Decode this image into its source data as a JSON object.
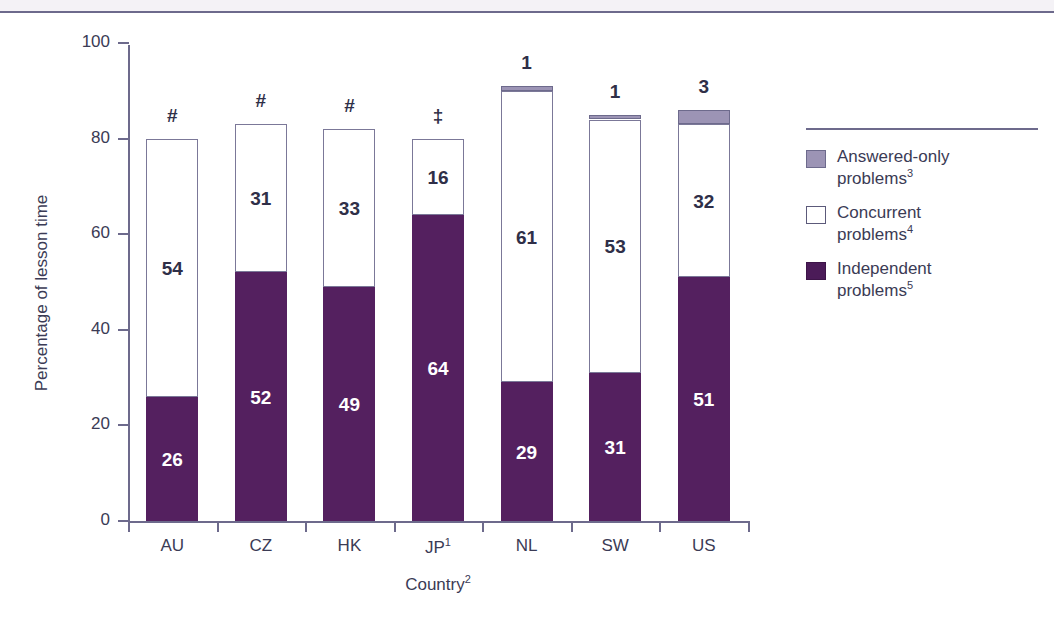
{
  "chart_data": {
    "type": "bar",
    "subtype": "stacked-bar",
    "title": "",
    "xlabel": "Country",
    "xlabel_superscript": "2",
    "ylabel": "Percentage of lesson time",
    "ylim": [
      0,
      100
    ],
    "ytick_labels": [
      "0",
      "20",
      "40",
      "60",
      "80",
      "100"
    ],
    "ytick_values": [
      0,
      20,
      40,
      60,
      80,
      100
    ],
    "grid": false,
    "legend_position": "right",
    "categories": [
      "AU",
      "CZ",
      "HK",
      "JP",
      "NL",
      "SW",
      "US"
    ],
    "category_labels": [
      {
        "text": "AU",
        "sup": ""
      },
      {
        "text": "CZ",
        "sup": ""
      },
      {
        "text": "HK",
        "sup": ""
      },
      {
        "text": "JP",
        "sup": "1"
      },
      {
        "text": "NL",
        "sup": ""
      },
      {
        "text": "SW",
        "sup": ""
      },
      {
        "text": "US",
        "sup": ""
      }
    ],
    "series": [
      {
        "name": "Independent problems",
        "key": "independent",
        "color": "#54205f",
        "values": [
          26,
          52,
          49,
          64,
          29,
          31,
          51
        ]
      },
      {
        "name": "Concurrent problems",
        "key": "concurrent",
        "color": "#ffffff",
        "values": [
          54,
          31,
          33,
          16,
          61,
          53,
          32
        ]
      },
      {
        "name": "Answered-only problems",
        "key": "answered",
        "color": "#9c94b5",
        "values": [
          0,
          0,
          0,
          0,
          1,
          1,
          3
        ]
      }
    ],
    "bar_top_markers": [
      "#",
      "#",
      "#",
      "‡",
      "1",
      "1",
      "3"
    ],
    "segment_labels": {
      "independent": [
        "26",
        "52",
        "49",
        "64",
        "29",
        "31",
        "51"
      ],
      "concurrent": [
        "54",
        "31",
        "33",
        "16",
        "61",
        "53",
        "32"
      ],
      "answered": [
        "",
        "",
        "",
        "",
        "",
        "",
        ""
      ]
    },
    "totals": [
      80,
      83,
      82,
      80,
      91,
      85,
      86
    ]
  },
  "legend": {
    "items": [
      {
        "label": "Answered-only",
        "label2": "problems",
        "sup": "3",
        "swatch": "answered",
        "color": "#9c94b5"
      },
      {
        "label": "Concurrent",
        "label2": "problems",
        "sup": "4",
        "swatch": "concurrent",
        "color": "#ffffff"
      },
      {
        "label": "Independent",
        "label2": "problems",
        "sup": "5",
        "swatch": "independent",
        "color": "#4b1b58"
      }
    ]
  },
  "colors": {
    "independent": "#54205f",
    "concurrent": "#ffffff",
    "answered": "#9c94b5",
    "axis": "#6d6a8c",
    "text": "#3b3b55"
  }
}
